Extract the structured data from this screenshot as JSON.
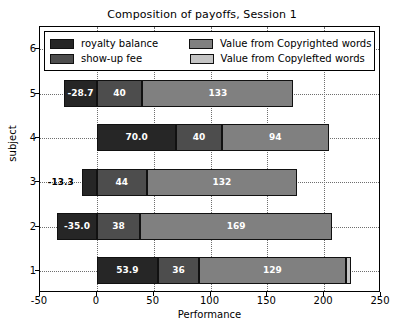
{
  "chart_data": {
    "type": "bar",
    "orientation": "horizontal",
    "stacked": true,
    "title": "Composition of payoffs, Session 1",
    "xlabel": "Performance",
    "ylabel": "subject",
    "xlim": [
      -50,
      250
    ],
    "ylim": [
      0.5,
      6.5
    ],
    "xticks": [
      -50,
      0,
      50,
      100,
      150,
      200,
      250
    ],
    "xticklabels": [
      "-50",
      "0",
      "50",
      "100",
      "150",
      "200",
      "250"
    ],
    "yticks": [
      1,
      2,
      3,
      4,
      5,
      6
    ],
    "yticklabels": [
      "1",
      "2",
      "3",
      "4",
      "5",
      "6"
    ],
    "grid": true,
    "legend_position": "upper center",
    "categories": [
      "1",
      "2",
      "3",
      "4",
      "5",
      "6"
    ],
    "series": [
      {
        "name": "royalty balance",
        "color": "#262626",
        "values": [
          53.9,
          -35.0,
          -13.3,
          70.0,
          -28.7,
          -46.9
        ],
        "labels": [
          "53.9",
          "-35.0",
          "-13.3",
          "70.0",
          "-28.7",
          "-46.9"
        ]
      },
      {
        "name": "show-up fee",
        "color": "#4d4d4d",
        "values": [
          36,
          38,
          44,
          40,
          40,
          38
        ],
        "labels": [
          "36",
          "38",
          "44",
          "40",
          "40",
          "38"
        ]
      },
      {
        "name": "Value from Copyrighted words",
        "color": "#808080",
        "values": [
          129,
          169,
          132,
          94,
          133,
          172
        ],
        "labels": [
          "129",
          "169",
          "132",
          "94",
          "133",
          "172"
        ]
      },
      {
        "name": "Value from Copylefted words",
        "color": "#c4c4c4",
        "values": [
          5,
          0,
          0,
          0,
          0,
          0
        ],
        "labels": [
          "",
          "",
          "",
          "",
          "",
          ""
        ]
      }
    ]
  },
  "legend": {
    "entries": [
      {
        "label": "royalty balance",
        "color": "#262626"
      },
      {
        "label": "Value from Copyrighted words",
        "color": "#808080"
      },
      {
        "label": "show-up fee",
        "color": "#4d4d4d"
      },
      {
        "label": "Value from Copylefted words",
        "color": "#c4c4c4"
      }
    ]
  }
}
